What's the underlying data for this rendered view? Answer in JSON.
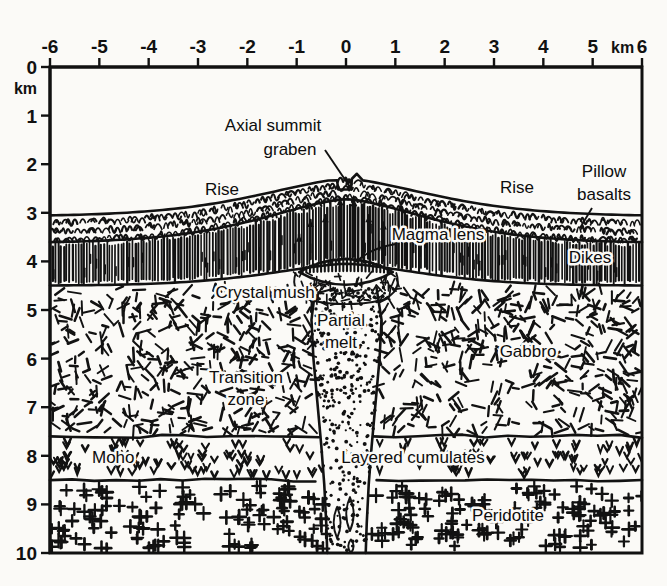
{
  "figure": {
    "type": "cross-section-diagram"
  },
  "axes": {
    "x": {
      "unit": "km",
      "unit_label": "km",
      "min": -6,
      "max": 6,
      "ticks": [
        "-6",
        "-5",
        "-4",
        "-3",
        "-2",
        "-1",
        "0",
        "1",
        "2",
        "3",
        "4",
        "5",
        "6"
      ],
      "position": "top"
    },
    "y": {
      "unit": "km",
      "unit_label": "km",
      "min": 0,
      "max": 10,
      "ticks": [
        "0",
        "1",
        "2",
        "3",
        "4",
        "5",
        "6",
        "7",
        "8",
        "9",
        "10"
      ],
      "position": "left",
      "direction": "downward-depth"
    }
  },
  "labels": {
    "axial_summit_graben_line1": "Axial summit",
    "axial_summit_graben_line2": "graben",
    "rise_left": "Rise",
    "rise_right": "Rise",
    "pillow_basalts_line1": "Pillow",
    "pillow_basalts_line2": "basalts",
    "magma_lens": "Magma lens",
    "dikes": "Dikes",
    "crystal_mush": "Crystal mush",
    "partial_melt_line1": "Partial",
    "partial_melt_line2": "melt",
    "gabbro": "Gabbro",
    "transition_zone_line1": "Transition",
    "transition_zone_line2": "zone",
    "moho": "Moho",
    "layered_cumulates": "Layered cumulates",
    "peridotite": "Peridotite"
  },
  "layers": [
    {
      "name": "Pillow basalts",
      "pattern": "arc-squiggle",
      "top_depth_km": 3.0,
      "base_depth_km": 3.6
    },
    {
      "name": "Dikes",
      "pattern": "vertical-lines",
      "top_depth_km": 3.6,
      "base_depth_km": 4.5
    },
    {
      "name": "Gabbro",
      "pattern": "short-dashes",
      "top_depth_km": 4.5,
      "base_depth_km": 7.6
    },
    {
      "name": "Layered cumulates",
      "pattern": "v-marks",
      "top_depth_km": 7.6,
      "base_depth_km": 8.5
    },
    {
      "name": "Peridotite",
      "pattern": "plus-marks",
      "top_depth_km": 8.5,
      "base_depth_km": 10.0
    },
    {
      "name": "Partial melt",
      "pattern": "stipple-dots",
      "top_depth_km": 4.3,
      "base_depth_km": 10.0
    }
  ],
  "colors": {
    "ink": "#111111",
    "background": "#fbfaf7"
  }
}
